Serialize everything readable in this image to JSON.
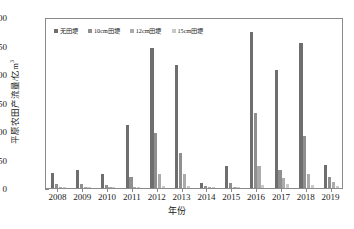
{
  "chart_data": {
    "type": "bar",
    "title": "",
    "xlabel": "年份",
    "ylabel": "平原农田产流量/亿m³",
    "ylabel_main": "平原农田产流量/亿m",
    "ylabel_sup": "3",
    "categories": [
      "2008",
      "2009",
      "2010",
      "2011",
      "2012",
      "2013",
      "2014",
      "2015",
      "2016",
      "2017",
      "2018",
      "2019"
    ],
    "ylim": [
      0,
      300
    ],
    "yticks": [
      0,
      50,
      100,
      150,
      200,
      250,
      300
    ],
    "grid": false,
    "legend_position": "top-left",
    "series": [
      {
        "name": "无田埂",
        "color": "#6e6e6e",
        "values": [
          27,
          31,
          25,
          111,
          245,
          215,
          8,
          39,
          273,
          207,
          255,
          41
        ]
      },
      {
        "name": "10cm田埂",
        "color": "#8f8f8f",
        "values": [
          7,
          7,
          6,
          20,
          97,
          62,
          4,
          9,
          131,
          32,
          92,
          20
        ]
      },
      {
        "name": "12cm田埂",
        "color": "#ababab",
        "values": [
          1,
          1,
          1,
          2,
          24,
          24,
          1,
          2,
          38,
          17,
          25,
          11
        ]
      },
      {
        "name": "15cm田埂",
        "color": "#c9c9c9",
        "values": [
          1,
          1,
          1,
          1,
          4,
          4,
          1,
          1,
          5,
          7,
          5,
          4
        ]
      }
    ]
  },
  "axes": {
    "frame_color": "#8a8a8a",
    "tick_color": "#8a8a8a",
    "text_color": "#1a1a1a"
  }
}
